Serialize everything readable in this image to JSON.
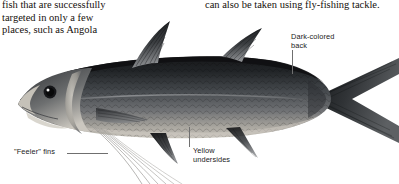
{
  "page": {
    "width": 399,
    "height": 184,
    "background": "#ffffff"
  },
  "body_text": {
    "left_column": "fish that are successfully\ntargeted in only a few\nplaces, such as Angola",
    "right_column": "can also be taken using fly-fishing tackle."
  },
  "illustration": {
    "subject": "threadfin-fish-side-view",
    "description": "Grayscale side-view photograph of a dark-backed threadfin fish with a deeply forked tail and long trailing feeler filaments",
    "colors": {
      "back": "#1f2124",
      "midbody": "#4a4e52",
      "belly": "#b9b5ad",
      "fin": "#2b2d30",
      "filament": "#9a9a98",
      "eye": "#141414",
      "eye_highlight": "#ffffff"
    }
  },
  "annotations": [
    {
      "id": "dark-colored-back",
      "text": "Dark-colored\nback",
      "leader": "vertical-down"
    },
    {
      "id": "yellow-undersides",
      "text": "Yellow\nundersides",
      "leader": "vertical-up"
    },
    {
      "id": "feeler-fins",
      "text": "\"Feeler\" fins",
      "leader": "horizontal-right"
    }
  ]
}
